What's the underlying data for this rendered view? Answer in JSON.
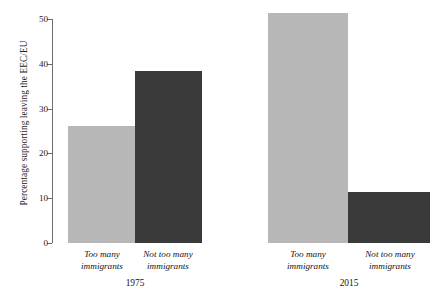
{
  "chart_data": {
    "type": "bar",
    "title": "",
    "xlabel": "",
    "ylabel": "Percentage supporting leaving the EEC/EU",
    "ylim": [
      0,
      50
    ],
    "yticks": [
      0,
      10,
      20,
      30,
      40,
      50
    ],
    "ytick_labels": [
      "0",
      "10",
      "20",
      "30",
      "40",
      "50"
    ],
    "grid": false,
    "legend": "none",
    "categories": [
      "Too many immigrants",
      "Not too many immigrants"
    ],
    "groups": [
      "1975",
      "2015"
    ],
    "series": [
      {
        "name": "Too many immigrants",
        "values": [
          26.1,
          51.3
        ],
        "color": "#b7b7b7"
      },
      {
        "name": "Not too many immigrants",
        "values": [
          38.3,
          11.4
        ],
        "color": "#3a3a3a"
      }
    ],
    "bars": [
      {
        "group": "1975",
        "category": "Too many immigrants",
        "value": 26.1,
        "color": "#b7b7b7"
      },
      {
        "group": "1975",
        "category": "Not too many immigrants",
        "value": 38.3,
        "color": "#3a3a3a"
      },
      {
        "group": "2015",
        "category": "Too many immigrants",
        "value": 51.3,
        "color": "#b7b7b7"
      },
      {
        "group": "2015",
        "category": "Not too many immigrants",
        "value": 11.4,
        "color": "#3a3a3a"
      }
    ]
  },
  "axis": {
    "y_title": "Percentage supporting leaving the EEC/EU",
    "ticks": [
      {
        "label": "50",
        "value": 50
      },
      {
        "label": "40",
        "value": 40
      },
      {
        "label": "30",
        "value": 30
      },
      {
        "label": "20",
        "value": 20
      },
      {
        "label": "10",
        "value": 10
      },
      {
        "label": "0",
        "value": 0
      }
    ]
  },
  "labels": {
    "cat_1975_a_line1": "Too many",
    "cat_1975_a_line2": "immigrants",
    "cat_1975_b_line1": "Not too many",
    "cat_1975_b_line2": "immigrants",
    "cat_2015_a_line1": "Too many",
    "cat_2015_a_line2": "immigrants",
    "cat_2015_b_line1": "Not too many",
    "cat_2015_b_line2": "immigrants",
    "group_1975": "1975",
    "group_2015": "2015"
  },
  "colors": {
    "light_bar": "#b7b7b7",
    "dark_bar": "#3a3a3a",
    "axis": "#6d6d6d",
    "text": "#141414",
    "background": "#ffffff"
  }
}
